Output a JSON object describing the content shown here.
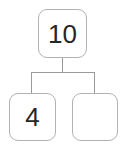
{
  "diagram": {
    "type": "number-bond-tree",
    "colors": {
      "box_border": "#b2b2b2",
      "box_fill": "#ffffff",
      "connector_line": "#9a9a9a",
      "digit_text": "#262626",
      "background": "#ffffff"
    },
    "root": {
      "id": "root",
      "label": "10",
      "filled": true
    },
    "children": [
      {
        "id": "child-left",
        "label": "4",
        "filled": true
      },
      {
        "id": "child-right",
        "label": "",
        "filled": false
      }
    ],
    "connectors": [
      {
        "id": "root-stem",
        "orientation": "vertical"
      },
      {
        "id": "crossbar",
        "orientation": "horizontal"
      },
      {
        "id": "left-drop",
        "orientation": "vertical"
      },
      {
        "id": "right-drop",
        "orientation": "vertical"
      }
    ]
  }
}
